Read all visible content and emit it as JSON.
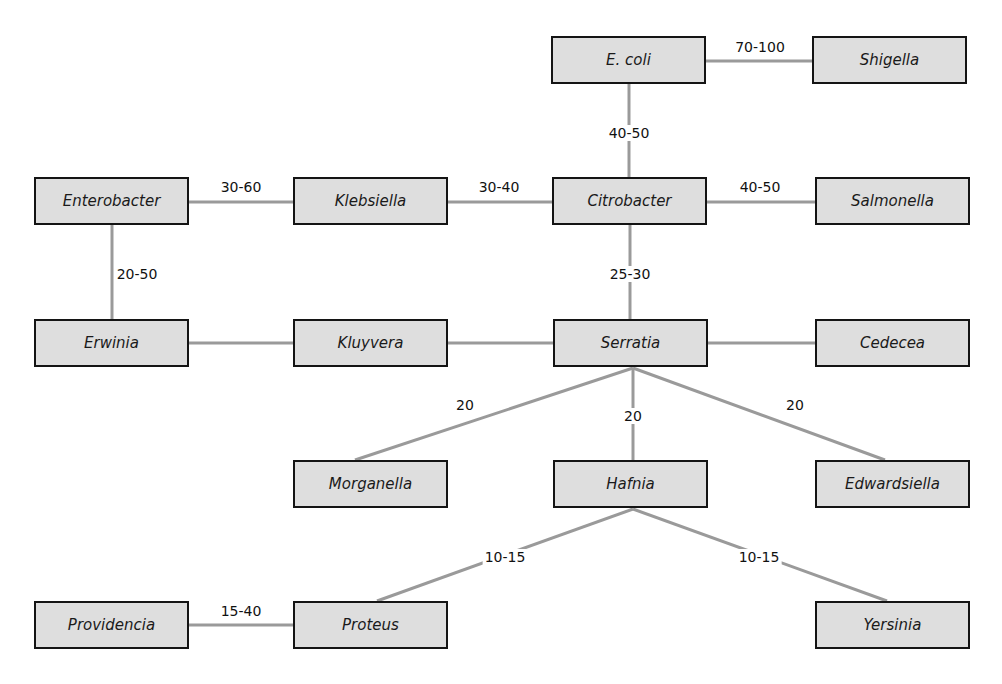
{
  "diagram": {
    "line_color": "#9a9a9a",
    "box_fill": "#dedede",
    "box_border": "#141414",
    "nodes": {
      "ecoli": {
        "label": "E. coli",
        "x": 551,
        "y": 36
      },
      "shigella": {
        "label": "Shigella",
        "x": 812,
        "y": 36
      },
      "enterobacter": {
        "label": "Enterobacter",
        "x": 34,
        "y": 177
      },
      "klebsiella": {
        "label": "Klebsiella",
        "x": 293,
        "y": 177
      },
      "citrobacter": {
        "label": "Citrobacter",
        "x": 552,
        "y": 177
      },
      "salmonella": {
        "label": "Salmonella",
        "x": 815,
        "y": 177
      },
      "erwinia": {
        "label": "Erwinia",
        "x": 34,
        "y": 319
      },
      "kluyvera": {
        "label": "Kluyvera",
        "x": 293,
        "y": 319
      },
      "serratia": {
        "label": "Serratia",
        "x": 553,
        "y": 319
      },
      "cedecea": {
        "label": "Cedecea",
        "x": 815,
        "y": 319
      },
      "morganella": {
        "label": "Morganella",
        "x": 293,
        "y": 460
      },
      "hafnia": {
        "label": "Hafnia",
        "x": 553,
        "y": 460
      },
      "edwardsiella": {
        "label": "Edwardsiella",
        "x": 815,
        "y": 460
      },
      "providencia": {
        "label": "Providencia",
        "x": 34,
        "y": 601
      },
      "proteus": {
        "label": "Proteus",
        "x": 293,
        "y": 601
      },
      "yersinia": {
        "label": "Yersinia",
        "x": 815,
        "y": 601
      }
    },
    "edges": [
      {
        "from": "ecoli",
        "to": "shigella",
        "label": "70-100"
      },
      {
        "from": "ecoli",
        "to": "citrobacter",
        "label": "40-50"
      },
      {
        "from": "enterobacter",
        "to": "klebsiella",
        "label": "30-60"
      },
      {
        "from": "klebsiella",
        "to": "citrobacter",
        "label": "30-40"
      },
      {
        "from": "citrobacter",
        "to": "salmonella",
        "label": "40-50"
      },
      {
        "from": "enterobacter",
        "to": "erwinia",
        "label": "20-50"
      },
      {
        "from": "citrobacter",
        "to": "serratia",
        "label": "25-30"
      },
      {
        "from": "erwinia",
        "to": "kluyvera",
        "label": ""
      },
      {
        "from": "kluyvera",
        "to": "serratia",
        "label": ""
      },
      {
        "from": "serratia",
        "to": "cedecea",
        "label": ""
      },
      {
        "from": "serratia",
        "to": "morganella",
        "label": "20"
      },
      {
        "from": "serratia",
        "to": "hafnia",
        "label": "20"
      },
      {
        "from": "serratia",
        "to": "edwardsiella",
        "label": "20"
      },
      {
        "from": "hafnia",
        "to": "proteus",
        "label": "10-15"
      },
      {
        "from": "hafnia",
        "to": "yersinia",
        "label": "10-15"
      },
      {
        "from": "providencia",
        "to": "proteus",
        "label": "15-40"
      }
    ],
    "edge_labels": {
      "ecoli_shigella": "70-100",
      "ecoli_citrobacter": "40-50",
      "enterobacter_klebsiella": "30-60",
      "klebsiella_citrobacter": "30-40",
      "citrobacter_salmonella": "40-50",
      "enterobacter_erwinia": "20-50",
      "citrobacter_serratia": "25-30",
      "serratia_morganella": "20",
      "serratia_hafnia": "20",
      "serratia_edwardsiella": "20",
      "hafnia_proteus": "10-15",
      "hafnia_yersinia": "10-15",
      "providencia_proteus": "15-40"
    }
  }
}
